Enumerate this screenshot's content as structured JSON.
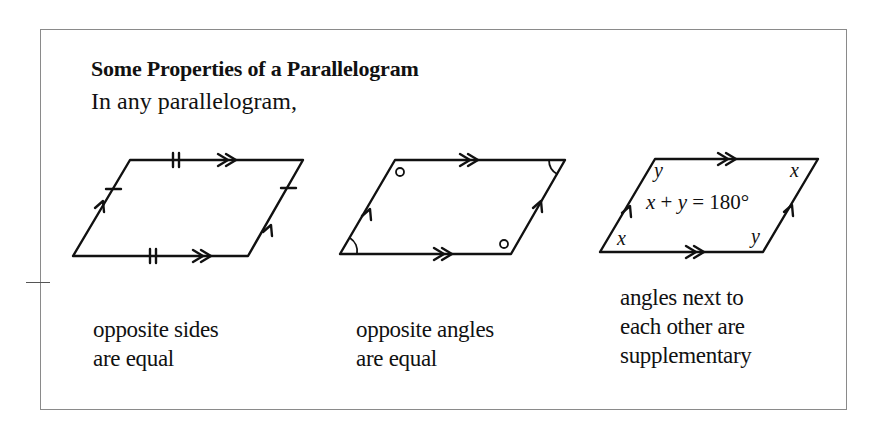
{
  "box": {
    "title": "Some Properties of a Parallelogram",
    "intro": "In any parallelogram,"
  },
  "figures": [
    {
      "id": "sides",
      "caption_lines": [
        "opposite sides",
        "are equal"
      ],
      "markings": [
        "single tick on slanted sides",
        "double tick on horizontal sides",
        "single arrow on slanted sides",
        "double arrow on horizontal sides"
      ]
    },
    {
      "id": "angles",
      "caption_lines": [
        "opposite angles",
        "are equal"
      ],
      "markings": [
        "circle marks on obtuse angles",
        "arc marks on acute angles",
        "single arrow on slanted sides",
        "double arrow on horizontal sides"
      ]
    },
    {
      "id": "supplementary",
      "caption_lines": [
        "angles next to",
        "each other are",
        "supplementary"
      ],
      "labels": {
        "top_left": "y",
        "top_right": "x",
        "bottom_left": "x",
        "bottom_right": "y"
      },
      "equation": "x + y =  180°"
    }
  ]
}
